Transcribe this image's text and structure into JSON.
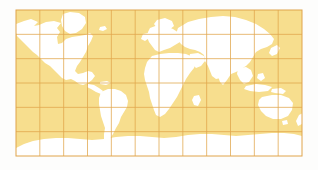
{
  "figure": {
    "title": "World Map",
    "caption": "Equirectangular world map with graticule",
    "width_px": 318,
    "height_px": 170,
    "background_color": "#fdfdfc"
  },
  "map": {
    "name": "world-map",
    "projection": "equirectangular",
    "frame": {
      "left_px": 16,
      "top_px": 10,
      "width_px": 286,
      "height_px": 146
    },
    "colors": {
      "ocean_fill": "#f7de8e",
      "land_fill": "#ffffff",
      "graticule_line": "#e0a44a",
      "border_line": "#e0a44a",
      "page_background": "#fdfdfc"
    },
    "graticule": {
      "meridian_count": 12,
      "parallel_count": 6,
      "meridian_spacing_deg": 30,
      "parallel_spacing_deg": 30,
      "line_width_px": 0.8,
      "visible": true
    },
    "extent": {
      "lon_min": -180,
      "lon_max": 180,
      "lat_min": -90,
      "lat_max": 90
    },
    "landmasses": [
      {
        "id": "north-america",
        "label": "North America"
      },
      {
        "id": "greenland",
        "label": "Greenland"
      },
      {
        "id": "south-america",
        "label": "South America"
      },
      {
        "id": "europe",
        "label": "Europe"
      },
      {
        "id": "africa",
        "label": "Africa"
      },
      {
        "id": "asia",
        "label": "Asia"
      },
      {
        "id": "australia",
        "label": "Australia"
      },
      {
        "id": "antarctica",
        "label": "Antarctica"
      },
      {
        "id": "british-isles",
        "label": "British Isles"
      },
      {
        "id": "japan",
        "label": "Japan"
      },
      {
        "id": "madagascar",
        "label": "Madagascar"
      },
      {
        "id": "new-zealand",
        "label": "New Zealand"
      },
      {
        "id": "indonesia",
        "label": "Indonesia"
      },
      {
        "id": "iceland",
        "label": "Iceland"
      }
    ]
  }
}
